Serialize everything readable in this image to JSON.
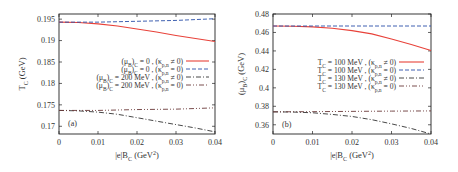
{
  "chart_data": [
    {
      "type": "line",
      "panel": "(a)",
      "xlabel": "|eB_C (GeV^2)",
      "xlabel_parts": {
        "main": "|e|B",
        "sub": "C",
        "unit_pre": " (GeV",
        "sup": "2",
        "unit_post": ")"
      },
      "ylabel": "T_C (GeV)",
      "ylabel_parts": {
        "main": "T",
        "sub": "C",
        "unit": " (GeV)"
      },
      "xlim": [
        0,
        0.04
      ],
      "ylim": [
        0.1682,
        0.1962
      ],
      "xticks": [
        0,
        0.01,
        0.02,
        0.03,
        0.04
      ],
      "xtick_labels": [
        "0",
        "0.01",
        "0.02",
        "0.03",
        "0.04"
      ],
      "yticks": [
        0.17,
        0.175,
        0.18,
        0.185,
        0.19,
        0.195
      ],
      "ytick_labels": [
        "0.17",
        "0.175",
        "0.18",
        "0.185",
        "0.19",
        "0.195"
      ],
      "grid": false,
      "legend_position": "center-right",
      "series": [
        {
          "name": "(μB)C = 0 , (κp,n ≠ 0)",
          "label_a": "(μ",
          "label_b": "B",
          "label_c": ")",
          "label_d": "C",
          "label_e": " = 0 , (κ",
          "label_f": "p,n",
          "label_g": " ≠ 0)",
          "color": "#e8423a",
          "dash": "solid",
          "x": [
            0,
            0.005,
            0.01,
            0.015,
            0.02,
            0.025,
            0.03,
            0.035,
            0.04
          ],
          "y": [
            0.1943,
            0.1942,
            0.1939,
            0.1934,
            0.1927,
            0.192,
            0.1912,
            0.1905,
            0.1898
          ]
        },
        {
          "name": "(μB)C = 0 , (κp,n = 0)",
          "label_a": "(μ",
          "label_b": "B",
          "label_c": ")",
          "label_d": "C",
          "label_e": " = 0 , (κ",
          "label_f": "p,n",
          "label_g": " = 0)",
          "color": "#2a4fa8",
          "dash": "4,2",
          "x": [
            0,
            0.01,
            0.02,
            0.03,
            0.04
          ],
          "y": [
            0.1943,
            0.1943,
            0.1945,
            0.1947,
            0.1951
          ]
        },
        {
          "name": "(μB)C = 200 MeV , (κp,n ≠ 0)",
          "label_a": "(μ",
          "label_b": "B",
          "label_c": ")",
          "label_d": "C",
          "label_e": " = 200 MeV , (κ",
          "label_f": "p,n",
          "label_g": " ≠ 0)",
          "color": "#333333",
          "dash": "5,2,1,2",
          "x": [
            0,
            0.005,
            0.01,
            0.015,
            0.02,
            0.025,
            0.03,
            0.035,
            0.04
          ],
          "y": [
            0.1737,
            0.1736,
            0.1733,
            0.1728,
            0.172,
            0.1712,
            0.1704,
            0.1696,
            0.1687
          ]
        },
        {
          "name": "(μB)C = 200 MeV , (κp,n = 0)",
          "label_a": "(μ",
          "label_b": "B",
          "label_c": ")",
          "label_d": "C",
          "label_e": " = 200 MeV , (κ",
          "label_f": "p,n",
          "label_g": " = 0)",
          "color": "#6b3a3a",
          "dash": "5,2,1,2,1,2",
          "x": [
            0,
            0.01,
            0.02,
            0.03,
            0.04
          ],
          "y": [
            0.1737,
            0.1737,
            0.1739,
            0.174,
            0.1743
          ]
        }
      ]
    },
    {
      "type": "line",
      "panel": "(b)",
      "xlabel": "|eB_C (GeV^2)",
      "xlabel_parts": {
        "main": "|e|B",
        "sub": "C",
        "unit_pre": " (GeV",
        "sup": "2",
        "unit_post": ")"
      },
      "ylabel": "(μB)C (GeV)",
      "ylabel_parts": {
        "main": "(μ",
        "sub": "B",
        "mid": ")",
        "sub2": "C",
        "unit": " (GeV)"
      },
      "xlim": [
        0,
        0.04
      ],
      "ylim": [
        0.35,
        0.48
      ],
      "xticks": [
        0,
        0.01,
        0.02,
        0.03,
        0.04
      ],
      "xtick_labels": [
        "0",
        "0.01",
        "0.02",
        "0.03",
        "0.04"
      ],
      "yticks": [
        0.36,
        0.38,
        0.4,
        0.42,
        0.44,
        0.46,
        0.48
      ],
      "ytick_labels": [
        "0.36",
        "0.38",
        "0.4",
        "0.42",
        "0.44",
        "0.46",
        "0.48"
      ],
      "grid": false,
      "legend_position": "center-right",
      "series": [
        {
          "name": "TC = 100 MeV , (κp,n ≠ 0)",
          "label_a": "T",
          "label_b": "C",
          "label_c": " = 100 MeV , (κ",
          "label_d": "p,n",
          "label_e": " ≠ 0)",
          "color": "#e8423a",
          "dash": "solid",
          "x": [
            0,
            0.005,
            0.01,
            0.015,
            0.02,
            0.025,
            0.03,
            0.035,
            0.04
          ],
          "y": [
            0.467,
            0.4668,
            0.466,
            0.4645,
            0.462,
            0.4585,
            0.453,
            0.447,
            0.4405
          ]
        },
        {
          "name": "TC = 100 MeV , (κp,n = 0)",
          "label_a": "T",
          "label_b": "C",
          "label_c": " = 100 MeV , (κ",
          "label_d": "p,n",
          "label_e": " = 0)",
          "color": "#2a4fa8",
          "dash": "4,2",
          "x": [
            0,
            0.01,
            0.02,
            0.03,
            0.04
          ],
          "y": [
            0.467,
            0.467,
            0.467,
            0.467,
            0.467
          ]
        },
        {
          "name": "TC = 130 MeV , (κp,n ≠ 0)",
          "label_a": "T",
          "label_b": "C",
          "label_c": " = 130 MeV , (κ",
          "label_d": "p,n",
          "label_e": " ≠ 0)",
          "color": "#333333",
          "dash": "5,2,1,2",
          "x": [
            0,
            0.005,
            0.01,
            0.015,
            0.02,
            0.025,
            0.03,
            0.035,
            0.04
          ],
          "y": [
            0.374,
            0.3738,
            0.373,
            0.3712,
            0.369,
            0.3655,
            0.361,
            0.356,
            0.35
          ]
        },
        {
          "name": "TC = 130 MeV , (κp,n = 0)",
          "label_a": "T",
          "label_b": "C",
          "label_c": " = 130 MeV , (κ",
          "label_d": "p,n",
          "label_e": " = 0)",
          "color": "#6b3a3a",
          "dash": "5,2,1,2,1,2",
          "x": [
            0,
            0.01,
            0.02,
            0.03,
            0.04
          ],
          "y": [
            0.374,
            0.3742,
            0.3745,
            0.3748,
            0.375
          ]
        }
      ]
    }
  ],
  "layout": {
    "panels": [
      {
        "x0": 59,
        "x1": 215,
        "y0": 14,
        "y1": 134,
        "legend_x_text_right": 183,
        "legend_line_x0": 186,
        "legend_line_x1": 209,
        "legend_y0": 61,
        "legend_dy": 8,
        "tag_x": 68,
        "tag_y": 126,
        "ylabel_x": 25,
        "ylabel_y": 74,
        "xlabel_x": 137,
        "xlabel_y": 158
      },
      {
        "x0": 273,
        "x1": 431,
        "y0": 14,
        "y1": 134,
        "legend_x_text_right": 396,
        "legend_line_x0": 399,
        "legend_line_x1": 424,
        "legend_y0": 62,
        "legend_dy": 8,
        "tag_x": 282,
        "tag_y": 127,
        "ylabel_x": 244,
        "ylabel_y": 74,
        "xlabel_x": 352,
        "xlabel_y": 158
      }
    ]
  }
}
